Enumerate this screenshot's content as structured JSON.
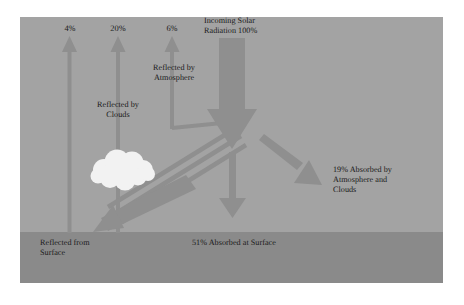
{
  "diagram": {
    "colors": {
      "page_background": "#ffffff",
      "sky": "#a3a3a3",
      "ground": "#8a8a8a",
      "arrow": "#8f8f8f",
      "arrow_dark": "#898989",
      "cloud": "#f2f2f2",
      "text": "#1a1a1a"
    },
    "upward_flows": [
      {
        "percent": "4%",
        "label": "",
        "x": 70
      },
      {
        "percent": "20%",
        "label": "Reflected by\nClouds",
        "x": 118
      },
      {
        "percent": "6%",
        "label": "Reflected by\nAtmosphere",
        "x": 172
      }
    ],
    "incoming": {
      "label_line1": "Incoming Solar",
      "label_line2": "Radiation 100%",
      "percent": "100%"
    },
    "absorbed_atmosphere": {
      "line1": "19% Absorbed by",
      "line2": "Atmosphere and",
      "line3": "Clouds",
      "percent": "19%"
    },
    "absorbed_surface": {
      "label": "51% Absorbed at Surface",
      "percent": "51%"
    },
    "reflected_surface": {
      "line1": "Reflected from",
      "line2": "Surface"
    },
    "cloud": {
      "name": "cloud-shape"
    }
  }
}
